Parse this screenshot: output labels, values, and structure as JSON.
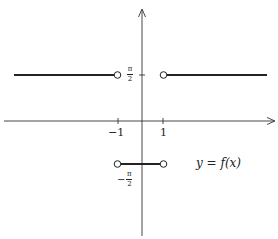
{
  "diagram": {
    "type": "piecewise-function-graph",
    "function_label": "y = f(x)",
    "x_ticks": [
      {
        "value": -1,
        "label": "−1"
      },
      {
        "value": 1,
        "label": "1"
      }
    ],
    "y_ticks": [
      {
        "value": "pi/2",
        "numerator": "π",
        "denominator": "2",
        "sign": ""
      },
      {
        "value": "-pi/2",
        "numerator": "π",
        "denominator": "2",
        "sign": "−"
      }
    ],
    "segments": [
      {
        "domain": "x < -1",
        "value": "pi/2",
        "right_endpoint": "open"
      },
      {
        "domain": "-1 < x < 1",
        "value": "-pi/2",
        "left_endpoint": "open",
        "right_endpoint": "open"
      },
      {
        "domain": "x > 1",
        "value": "pi/2",
        "left_endpoint": "open"
      }
    ],
    "colors": {
      "line": "#222222",
      "background": "#ffffff"
    }
  }
}
